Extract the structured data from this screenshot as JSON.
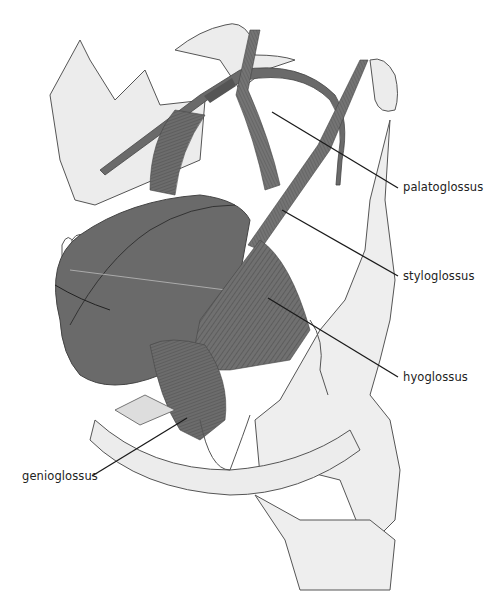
{
  "figure": {
    "colors": {
      "muscle": "#6e6e6e",
      "muscle_dark": "#555555",
      "tongue": "#6a6a6a",
      "bone": "#ececec",
      "outline": "#555555",
      "leader": "#1a1a1a",
      "tooth": "#ffffff"
    }
  },
  "labels": [
    {
      "id": "palatoglossus",
      "text": "palatoglossus"
    },
    {
      "id": "styloglossus",
      "text": "styloglossus"
    },
    {
      "id": "hyoglossus",
      "text": "hyoglossus"
    },
    {
      "id": "genioglossus",
      "text": "genioglossus"
    }
  ]
}
